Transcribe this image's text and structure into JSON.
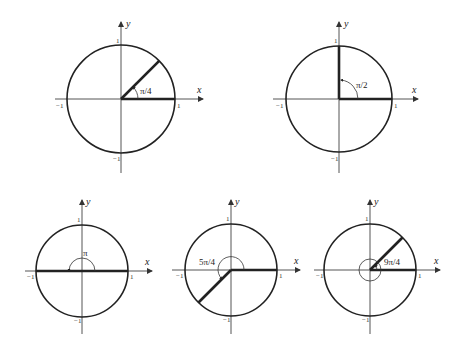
{
  "diagrams": [
    {
      "angle_label": "π/4",
      "x_label": "x",
      "y_label": "y",
      "ticks": {
        "pos_x": "1",
        "neg_x": "−1",
        "pos_y": "1",
        "neg_y": "−1"
      },
      "angle_radians": 0.7854
    },
    {
      "angle_label": "π/2",
      "x_label": "x",
      "y_label": "y",
      "ticks": {
        "pos_x": "1",
        "neg_x": "−1",
        "pos_y": "1",
        "neg_y": "−1"
      },
      "angle_radians": 1.5708
    },
    {
      "angle_label": "π",
      "x_label": "x",
      "y_label": "y",
      "ticks": {
        "pos_x": "1",
        "neg_x": "−1",
        "pos_y": "1",
        "neg_y": "−1"
      },
      "angle_radians": 3.1416
    },
    {
      "angle_label": "5π/4",
      "x_label": "x",
      "y_label": "y",
      "ticks": {
        "pos_x": "1",
        "neg_x": "−1",
        "pos_y": "1",
        "neg_y": "−1"
      },
      "angle_radians": 3.927
    },
    {
      "angle_label": "9π/4",
      "x_label": "x",
      "y_label": "y",
      "ticks": {
        "pos_x": "1",
        "neg_x": "−1",
        "pos_y": "1",
        "neg_y": "−1"
      },
      "angle_radians": 7.0686
    }
  ]
}
